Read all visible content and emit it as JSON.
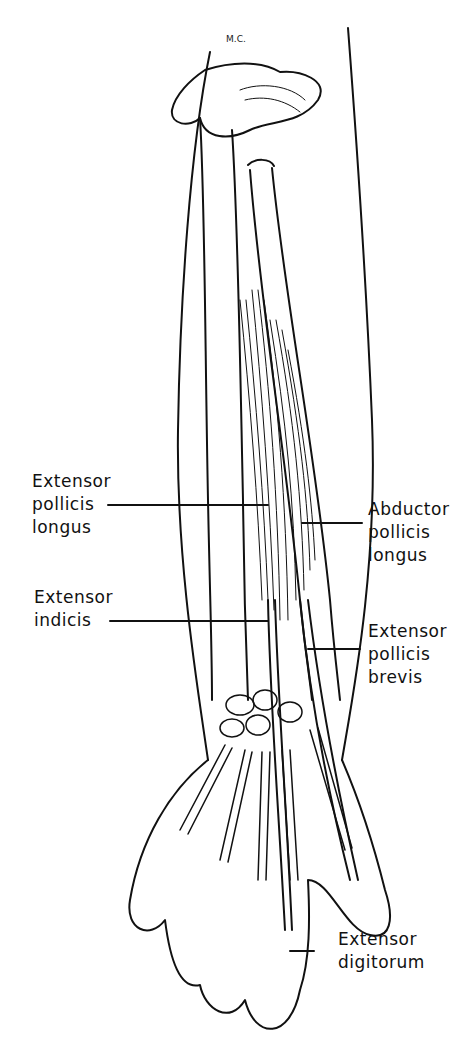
{
  "figure": {
    "signature": "M.C."
  },
  "labels": {
    "extensor_pollicis_longus": {
      "line1": "Extensor",
      "line2": "pollicis",
      "line3": "longus"
    },
    "extensor_indicis": {
      "line1": "Extensor",
      "line2": "indicis"
    },
    "abductor_pollicis_longus": {
      "line1": "Abductor",
      "line2": "pollicis",
      "line3": "longus"
    },
    "extensor_pollicis_brevis": {
      "line1": "Extensor",
      "line2": "pollicis",
      "line3": "brevis"
    },
    "extensor_digitorum": {
      "line1": "Extensor",
      "line2": "digitorum"
    }
  },
  "colors": {
    "ink": "#111111",
    "background": "#ffffff"
  }
}
